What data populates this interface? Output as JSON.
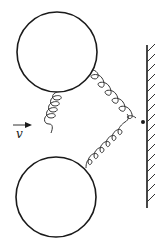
{
  "diagram": {
    "labels": {
      "velocity": "v"
    },
    "elements": {
      "top_ball": {
        "cx": 57,
        "cy": 52,
        "r": 40
      },
      "bottom_ball": {
        "cx": 56,
        "cy": 197,
        "r": 40
      },
      "wall": {
        "x": 147,
        "y1": 45,
        "y2": 208,
        "hatch_side": "right"
      },
      "junction": {
        "x": 143,
        "y": 122
      },
      "springs": [
        {
          "name": "vertical-spring",
          "from": "top_ball",
          "to": "bottom_ball"
        },
        {
          "name": "upper-spring",
          "from": "top_ball",
          "to": "junction"
        },
        {
          "name": "lower-spring",
          "from": "bottom_ball",
          "to": "junction"
        }
      ],
      "velocity_arrow": {
        "x1": 13,
        "x2": 32,
        "y": 125,
        "direction": "right"
      }
    },
    "colors": {
      "line": "#1a1a1a",
      "background": "#ffffff"
    }
  }
}
